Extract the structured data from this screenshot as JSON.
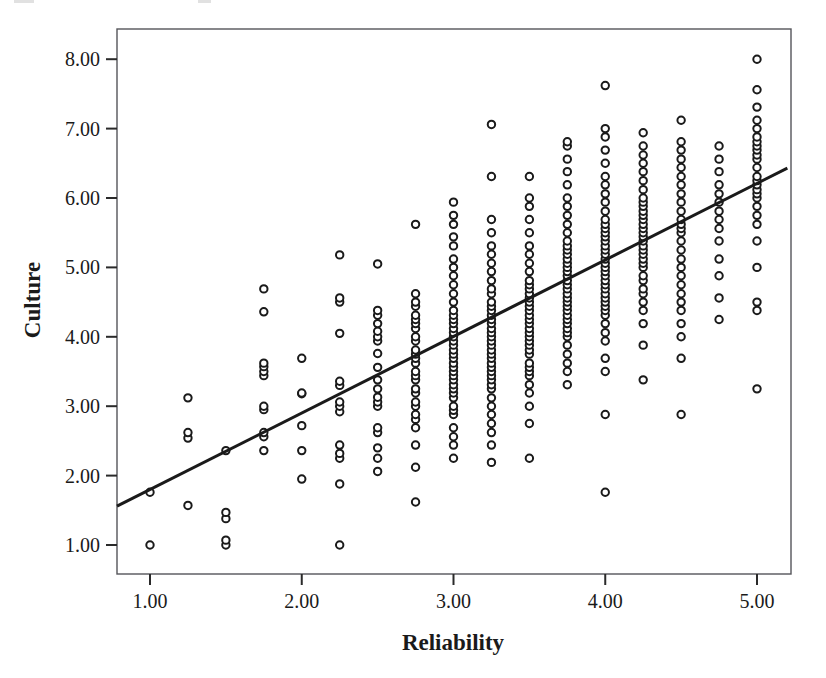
{
  "chart_data": {
    "type": "scatter",
    "title": "",
    "xlabel": "Reliability",
    "ylabel": "Culture",
    "xlim": [
      0.75,
      5.2
    ],
    "ylim": [
      0.55,
      8.35
    ],
    "xticks": [
      1.0,
      2.0,
      3.0,
      4.0,
      5.0
    ],
    "xtick_labels": [
      "1.00",
      "2.00",
      "3.00",
      "4.00",
      "5.00"
    ],
    "yticks": [
      1.0,
      2.0,
      3.0,
      4.0,
      5.0,
      6.0,
      7.0,
      8.0
    ],
    "ytick_labels": [
      "1.00",
      "2.00",
      "3.00",
      "4.00",
      "5.00",
      "6.00",
      "7.00",
      "8.00"
    ],
    "grid": false,
    "legend": "none",
    "marker": "open-circle",
    "marker_color": "#1a1a1a",
    "marker_size": 5,
    "frame_color": "#55555a",
    "background": "#ffffff",
    "fit_line": {
      "type": "linear-regression",
      "color": "#1a1a1a",
      "width": 3,
      "x_start": 0.78,
      "y_start": 1.56,
      "x_end": 5.2,
      "y_end": 6.43,
      "slope": 1.1,
      "intercept": 0.7
    },
    "points": [
      [
        1.0,
        1.0
      ],
      [
        1.0,
        1.76
      ],
      [
        1.25,
        2.54
      ],
      [
        1.25,
        2.62
      ],
      [
        1.25,
        3.12
      ],
      [
        1.25,
        1.57
      ],
      [
        1.5,
        1.0
      ],
      [
        1.5,
        1.07
      ],
      [
        1.5,
        1.38
      ],
      [
        1.5,
        1.47
      ],
      [
        1.5,
        2.36
      ],
      [
        1.75,
        2.36
      ],
      [
        1.75,
        2.56
      ],
      [
        1.75,
        2.62
      ],
      [
        1.75,
        2.95
      ],
      [
        1.75,
        3.0
      ],
      [
        1.75,
        3.44
      ],
      [
        1.75,
        3.5
      ],
      [
        1.75,
        3.57
      ],
      [
        1.75,
        3.62
      ],
      [
        1.75,
        4.36
      ],
      [
        1.75,
        4.69
      ],
      [
        2.0,
        1.95
      ],
      [
        2.0,
        2.36
      ],
      [
        2.0,
        2.72
      ],
      [
        2.0,
        3.18
      ],
      [
        2.0,
        3.19
      ],
      [
        2.0,
        3.69
      ],
      [
        2.25,
        1.0
      ],
      [
        2.25,
        1.88
      ],
      [
        2.25,
        2.25
      ],
      [
        2.25,
        2.32
      ],
      [
        2.25,
        2.44
      ],
      [
        2.25,
        2.92
      ],
      [
        2.25,
        3.0
      ],
      [
        2.25,
        3.06
      ],
      [
        2.25,
        3.3
      ],
      [
        2.25,
        3.36
      ],
      [
        2.25,
        4.05
      ],
      [
        2.25,
        4.5
      ],
      [
        2.25,
        4.56
      ],
      [
        2.25,
        5.18
      ],
      [
        2.5,
        2.06
      ],
      [
        2.5,
        2.25
      ],
      [
        2.5,
        2.4
      ],
      [
        2.5,
        2.62
      ],
      [
        2.5,
        2.69
      ],
      [
        2.5,
        3.0
      ],
      [
        2.5,
        3.06
      ],
      [
        2.5,
        3.13
      ],
      [
        2.5,
        3.25
      ],
      [
        2.5,
        3.38
      ],
      [
        2.5,
        3.56
      ],
      [
        2.5,
        3.76
      ],
      [
        2.5,
        3.94
      ],
      [
        2.5,
        4.0
      ],
      [
        2.5,
        4.08
      ],
      [
        2.5,
        4.19
      ],
      [
        2.5,
        4.31
      ],
      [
        2.5,
        4.38
      ],
      [
        2.5,
        5.05
      ],
      [
        2.75,
        1.62
      ],
      [
        2.75,
        2.12
      ],
      [
        2.75,
        2.44
      ],
      [
        2.75,
        2.69
      ],
      [
        2.75,
        2.81
      ],
      [
        2.75,
        2.88
      ],
      [
        2.75,
        3.0
      ],
      [
        2.75,
        3.06
      ],
      [
        2.75,
        3.19
      ],
      [
        2.75,
        3.25
      ],
      [
        2.75,
        3.38
      ],
      [
        2.75,
        3.44
      ],
      [
        2.75,
        3.5
      ],
      [
        2.75,
        3.62
      ],
      [
        2.75,
        3.69
      ],
      [
        2.75,
        3.75
      ],
      [
        2.75,
        3.81
      ],
      [
        2.75,
        3.94
      ],
      [
        2.75,
        4.0
      ],
      [
        2.75,
        4.12
      ],
      [
        2.75,
        4.19
      ],
      [
        2.75,
        4.25
      ],
      [
        2.75,
        4.31
      ],
      [
        2.75,
        4.44
      ],
      [
        2.75,
        4.5
      ],
      [
        2.75,
        4.62
      ],
      [
        2.75,
        5.62
      ],
      [
        3.0,
        2.25
      ],
      [
        3.0,
        2.44
      ],
      [
        3.0,
        2.56
      ],
      [
        3.0,
        2.69
      ],
      [
        3.0,
        2.88
      ],
      [
        3.0,
        2.94
      ],
      [
        3.0,
        3.0
      ],
      [
        3.0,
        3.12
      ],
      [
        3.0,
        3.19
      ],
      [
        3.0,
        3.25
      ],
      [
        3.0,
        3.31
      ],
      [
        3.0,
        3.38
      ],
      [
        3.0,
        3.44
      ],
      [
        3.0,
        3.5
      ],
      [
        3.0,
        3.56
      ],
      [
        3.0,
        3.62
      ],
      [
        3.0,
        3.69
      ],
      [
        3.0,
        3.75
      ],
      [
        3.0,
        3.81
      ],
      [
        3.0,
        3.88
      ],
      [
        3.0,
        3.94
      ],
      [
        3.0,
        4.0
      ],
      [
        3.0,
        4.06
      ],
      [
        3.0,
        4.12
      ],
      [
        3.0,
        4.19
      ],
      [
        3.0,
        4.25
      ],
      [
        3.0,
        4.31
      ],
      [
        3.0,
        4.38
      ],
      [
        3.0,
        4.5
      ],
      [
        3.0,
        4.62
      ],
      [
        3.0,
        4.75
      ],
      [
        3.0,
        4.88
      ],
      [
        3.0,
        5.0
      ],
      [
        3.0,
        5.12
      ],
      [
        3.0,
        5.31
      ],
      [
        3.0,
        5.44
      ],
      [
        3.0,
        5.62
      ],
      [
        3.0,
        5.75
      ],
      [
        3.0,
        5.94
      ],
      [
        3.25,
        2.19
      ],
      [
        3.25,
        2.44
      ],
      [
        3.25,
        2.62
      ],
      [
        3.25,
        2.75
      ],
      [
        3.25,
        2.88
      ],
      [
        3.25,
        3.0
      ],
      [
        3.25,
        3.12
      ],
      [
        3.25,
        3.25
      ],
      [
        3.25,
        3.31
      ],
      [
        3.25,
        3.38
      ],
      [
        3.25,
        3.44
      ],
      [
        3.25,
        3.5
      ],
      [
        3.25,
        3.56
      ],
      [
        3.25,
        3.62
      ],
      [
        3.25,
        3.69
      ],
      [
        3.25,
        3.75
      ],
      [
        3.25,
        3.81
      ],
      [
        3.25,
        3.88
      ],
      [
        3.25,
        3.94
      ],
      [
        3.25,
        4.0
      ],
      [
        3.25,
        4.06
      ],
      [
        3.25,
        4.12
      ],
      [
        3.25,
        4.19
      ],
      [
        3.25,
        4.25
      ],
      [
        3.25,
        4.31
      ],
      [
        3.25,
        4.38
      ],
      [
        3.25,
        4.44
      ],
      [
        3.25,
        4.5
      ],
      [
        3.25,
        4.62
      ],
      [
        3.25,
        4.69
      ],
      [
        3.25,
        4.81
      ],
      [
        3.25,
        4.94
      ],
      [
        3.25,
        5.06
      ],
      [
        3.25,
        5.19
      ],
      [
        3.25,
        5.31
      ],
      [
        3.25,
        5.5
      ],
      [
        3.25,
        5.69
      ],
      [
        3.25,
        6.31
      ],
      [
        3.25,
        7.06
      ],
      [
        3.5,
        2.25
      ],
      [
        3.5,
        2.75
      ],
      [
        3.5,
        3.0
      ],
      [
        3.5,
        3.19
      ],
      [
        3.5,
        3.31
      ],
      [
        3.5,
        3.44
      ],
      [
        3.5,
        3.5
      ],
      [
        3.5,
        3.56
      ],
      [
        3.5,
        3.62
      ],
      [
        3.5,
        3.75
      ],
      [
        3.5,
        3.81
      ],
      [
        3.5,
        3.88
      ],
      [
        3.5,
        3.94
      ],
      [
        3.5,
        4.0
      ],
      [
        3.5,
        4.06
      ],
      [
        3.5,
        4.12
      ],
      [
        3.5,
        4.19
      ],
      [
        3.5,
        4.25
      ],
      [
        3.5,
        4.31
      ],
      [
        3.5,
        4.38
      ],
      [
        3.5,
        4.44
      ],
      [
        3.5,
        4.5
      ],
      [
        3.5,
        4.56
      ],
      [
        3.5,
        4.62
      ],
      [
        3.5,
        4.69
      ],
      [
        3.5,
        4.75
      ],
      [
        3.5,
        4.81
      ],
      [
        3.5,
        4.94
      ],
      [
        3.5,
        5.06
      ],
      [
        3.5,
        5.19
      ],
      [
        3.5,
        5.31
      ],
      [
        3.5,
        5.5
      ],
      [
        3.5,
        5.69
      ],
      [
        3.5,
        5.88
      ],
      [
        3.5,
        6.0
      ],
      [
        3.5,
        6.31
      ],
      [
        3.75,
        3.31
      ],
      [
        3.75,
        3.5
      ],
      [
        3.75,
        3.62
      ],
      [
        3.75,
        3.75
      ],
      [
        3.75,
        3.88
      ],
      [
        3.75,
        4.0
      ],
      [
        3.75,
        4.06
      ],
      [
        3.75,
        4.12
      ],
      [
        3.75,
        4.19
      ],
      [
        3.75,
        4.25
      ],
      [
        3.75,
        4.31
      ],
      [
        3.75,
        4.38
      ],
      [
        3.75,
        4.44
      ],
      [
        3.75,
        4.5
      ],
      [
        3.75,
        4.56
      ],
      [
        3.75,
        4.62
      ],
      [
        3.75,
        4.69
      ],
      [
        3.75,
        4.75
      ],
      [
        3.75,
        4.81
      ],
      [
        3.75,
        4.88
      ],
      [
        3.75,
        4.94
      ],
      [
        3.75,
        5.0
      ],
      [
        3.75,
        5.06
      ],
      [
        3.75,
        5.12
      ],
      [
        3.75,
        5.19
      ],
      [
        3.75,
        5.25
      ],
      [
        3.75,
        5.31
      ],
      [
        3.75,
        5.38
      ],
      [
        3.75,
        5.5
      ],
      [
        3.75,
        5.62
      ],
      [
        3.75,
        5.75
      ],
      [
        3.75,
        5.88
      ],
      [
        3.75,
        6.0
      ],
      [
        3.75,
        6.19
      ],
      [
        3.75,
        6.38
      ],
      [
        3.75,
        6.56
      ],
      [
        3.75,
        6.75
      ],
      [
        3.75,
        6.81
      ],
      [
        4.0,
        1.76
      ],
      [
        4.0,
        2.88
      ],
      [
        4.0,
        3.5
      ],
      [
        4.0,
        3.69
      ],
      [
        4.0,
        3.94
      ],
      [
        4.0,
        4.06
      ],
      [
        4.0,
        4.19
      ],
      [
        4.0,
        4.31
      ],
      [
        4.0,
        4.38
      ],
      [
        4.0,
        4.44
      ],
      [
        4.0,
        4.5
      ],
      [
        4.0,
        4.56
      ],
      [
        4.0,
        4.62
      ],
      [
        4.0,
        4.69
      ],
      [
        4.0,
        4.75
      ],
      [
        4.0,
        4.81
      ],
      [
        4.0,
        4.88
      ],
      [
        4.0,
        4.94
      ],
      [
        4.0,
        5.0
      ],
      [
        4.0,
        5.06
      ],
      [
        4.0,
        5.12
      ],
      [
        4.0,
        5.19
      ],
      [
        4.0,
        5.25
      ],
      [
        4.0,
        5.31
      ],
      [
        4.0,
        5.38
      ],
      [
        4.0,
        5.44
      ],
      [
        4.0,
        5.5
      ],
      [
        4.0,
        5.56
      ],
      [
        4.0,
        5.62
      ],
      [
        4.0,
        5.69
      ],
      [
        4.0,
        5.81
      ],
      [
        4.0,
        5.94
      ],
      [
        4.0,
        6.06
      ],
      [
        4.0,
        6.19
      ],
      [
        4.0,
        6.31
      ],
      [
        4.0,
        6.5
      ],
      [
        4.0,
        6.69
      ],
      [
        4.0,
        6.88
      ],
      [
        4.0,
        7.0
      ],
      [
        4.0,
        7.62
      ],
      [
        4.25,
        3.38
      ],
      [
        4.25,
        3.88
      ],
      [
        4.25,
        4.19
      ],
      [
        4.25,
        4.38
      ],
      [
        4.25,
        4.5
      ],
      [
        4.25,
        4.62
      ],
      [
        4.25,
        4.69
      ],
      [
        4.25,
        4.81
      ],
      [
        4.25,
        4.88
      ],
      [
        4.25,
        5.0
      ],
      [
        4.25,
        5.06
      ],
      [
        4.25,
        5.12
      ],
      [
        4.25,
        5.19
      ],
      [
        4.25,
        5.25
      ],
      [
        4.25,
        5.31
      ],
      [
        4.25,
        5.38
      ],
      [
        4.25,
        5.44
      ],
      [
        4.25,
        5.5
      ],
      [
        4.25,
        5.56
      ],
      [
        4.25,
        5.62
      ],
      [
        4.25,
        5.69
      ],
      [
        4.25,
        5.75
      ],
      [
        4.25,
        5.81
      ],
      [
        4.25,
        5.88
      ],
      [
        4.25,
        5.94
      ],
      [
        4.25,
        6.0
      ],
      [
        4.25,
        6.12
      ],
      [
        4.25,
        6.25
      ],
      [
        4.25,
        6.38
      ],
      [
        4.25,
        6.5
      ],
      [
        4.25,
        6.62
      ],
      [
        4.25,
        6.75
      ],
      [
        4.25,
        6.94
      ],
      [
        4.5,
        2.88
      ],
      [
        4.5,
        3.69
      ],
      [
        4.5,
        4.0
      ],
      [
        4.5,
        4.19
      ],
      [
        4.5,
        4.38
      ],
      [
        4.5,
        4.5
      ],
      [
        4.5,
        4.62
      ],
      [
        4.5,
        4.75
      ],
      [
        4.5,
        4.88
      ],
      [
        4.5,
        5.0
      ],
      [
        4.5,
        5.12
      ],
      [
        4.5,
        5.25
      ],
      [
        4.5,
        5.38
      ],
      [
        4.5,
        5.5
      ],
      [
        4.5,
        5.56
      ],
      [
        4.5,
        5.62
      ],
      [
        4.5,
        5.69
      ],
      [
        4.5,
        5.81
      ],
      [
        4.5,
        5.94
      ],
      [
        4.5,
        6.06
      ],
      [
        4.5,
        6.19
      ],
      [
        4.5,
        6.31
      ],
      [
        4.5,
        6.44
      ],
      [
        4.5,
        6.56
      ],
      [
        4.5,
        6.69
      ],
      [
        4.5,
        6.81
      ],
      [
        4.5,
        7.12
      ],
      [
        4.75,
        4.25
      ],
      [
        4.75,
        4.56
      ],
      [
        4.75,
        4.88
      ],
      [
        4.75,
        5.12
      ],
      [
        4.75,
        5.38
      ],
      [
        4.75,
        5.56
      ],
      [
        4.75,
        5.69
      ],
      [
        4.75,
        5.81
      ],
      [
        4.75,
        5.94
      ],
      [
        4.75,
        6.06
      ],
      [
        4.75,
        6.19
      ],
      [
        4.75,
        6.38
      ],
      [
        4.75,
        6.56
      ],
      [
        4.75,
        6.75
      ],
      [
        5.0,
        3.25
      ],
      [
        5.0,
        4.38
      ],
      [
        5.0,
        4.5
      ],
      [
        5.0,
        5.0
      ],
      [
        5.0,
        5.38
      ],
      [
        5.0,
        5.62
      ],
      [
        5.0,
        5.75
      ],
      [
        5.0,
        5.88
      ],
      [
        5.0,
        6.0
      ],
      [
        5.0,
        6.06
      ],
      [
        5.0,
        6.12
      ],
      [
        5.0,
        6.19
      ],
      [
        5.0,
        6.25
      ],
      [
        5.0,
        6.31
      ],
      [
        5.0,
        6.44
      ],
      [
        5.0,
        6.56
      ],
      [
        5.0,
        6.62
      ],
      [
        5.0,
        6.69
      ],
      [
        5.0,
        6.75
      ],
      [
        5.0,
        6.81
      ],
      [
        5.0,
        6.88
      ],
      [
        5.0,
        7.0
      ],
      [
        5.0,
        7.12
      ],
      [
        5.0,
        7.31
      ],
      [
        5.0,
        7.56
      ],
      [
        5.0,
        8.0
      ]
    ]
  }
}
